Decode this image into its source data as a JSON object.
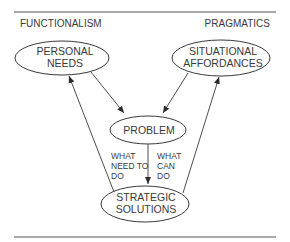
{
  "diagram": {
    "headings": {
      "left": "FUNCTIONALISM",
      "right": "PRAGMATICS"
    },
    "nodes": {
      "personal_needs": {
        "line1": "PERSONAL",
        "line2": "NEEDS"
      },
      "situational_affordances": {
        "line1": "SITUATIONAL",
        "line2": "AFFORDANCES"
      },
      "problem": {
        "line1": "PROBLEM"
      },
      "strategic_solutions": {
        "line1": "STRATEGIC",
        "line2": "SOLUTIONS"
      }
    },
    "edge_labels": {
      "left": {
        "line1": "WHAT",
        "line2": "NEED TO",
        "line3": "DO"
      },
      "right": {
        "line1": "WHAT",
        "line2": "CAN",
        "line3": "DO"
      }
    },
    "edges": [
      {
        "from": "personal_needs",
        "to": "problem"
      },
      {
        "from": "situational_affordances",
        "to": "problem"
      },
      {
        "from": "problem",
        "to": "strategic_solutions"
      },
      {
        "from": "strategic_solutions",
        "to": "personal_needs"
      },
      {
        "from": "strategic_solutions",
        "to": "situational_affordances"
      }
    ],
    "colors": {
      "ink": "#3a3a3a",
      "rule": "#555555",
      "background": "#ffffff"
    }
  }
}
